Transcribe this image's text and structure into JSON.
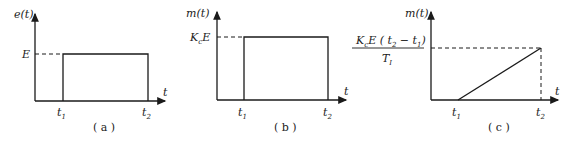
{
  "panels": [
    {
      "id": "a",
      "ylabel": "e(t)",
      "xlabel": "t",
      "level_label": "E",
      "t1": "t",
      "t1_sub": "1",
      "t2": "t",
      "t2_sub": "2",
      "caption": "( a )",
      "shape": "rectangular pulse from t1 to t2 at height E"
    },
    {
      "id": "b",
      "ylabel": "m(t)",
      "xlabel": "t",
      "level_label_main": "K",
      "level_label_sub": "c",
      "level_label_tail": "E",
      "t1": "t",
      "t1_sub": "1",
      "t2": "t",
      "t2_sub": "2",
      "caption": "( b )",
      "shape": "rectangular pulse from t1 to t2 at height KcE"
    },
    {
      "id": "c",
      "ylabel": "m(t)",
      "xlabel": "t",
      "level_numerator_a": "K",
      "level_numerator_a_sub": "c",
      "level_numerator_b": "E ( t",
      "level_numerator_b_sub": "2",
      "level_numerator_c": " − t",
      "level_numerator_c_sub": "1",
      "level_numerator_d": ")",
      "level_denominator": "T",
      "level_denominator_sub": "I",
      "t1": "t",
      "t1_sub": "1",
      "t2": "t",
      "t2_sub": "2",
      "caption": "( c )",
      "shape": "ramp from 0 at t1 to KcE(t2-t1)/TI at t2"
    }
  ],
  "colors": {
    "line": "#1a1a1a",
    "text": "#222222",
    "background": "#ffffff"
  }
}
